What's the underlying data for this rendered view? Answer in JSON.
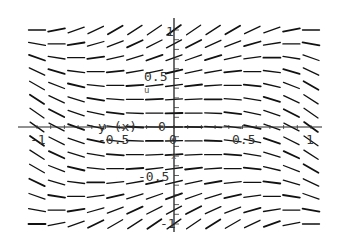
{
  "chart_data": {
    "type": "slope_field",
    "title": "",
    "equation": "dy/dx = y^2 - x^2",
    "xlabel": "x",
    "ylabel": "y (x)",
    "xlim": [
      -1.1,
      1.1
    ],
    "ylim": [
      -1.1,
      1.1
    ],
    "x_ticks": [
      "-1",
      "-0.5",
      "0",
      "0.5",
      "1"
    ],
    "y_ticks": [
      "-1",
      "-0.5",
      "0.5",
      "1"
    ],
    "grid": false,
    "legend": null,
    "grid_points": {
      "nx": 15,
      "ny": 15
    },
    "stray_label": "u"
  },
  "labels": {
    "x_axis_name": "x",
    "y_axis_name": "y (x)",
    "tick_neg1_x": "-1",
    "tick_neg05_x": "-0.5",
    "tick_0": "0",
    "tick_05_x": "0.5",
    "tick_1_x": "1",
    "tick_1_y": "1",
    "tick_05_y": "0.5",
    "tick_neg05_y": "-0.5",
    "tick_neg1_y": "-1",
    "stray": "u",
    "origin_zero": "0"
  }
}
